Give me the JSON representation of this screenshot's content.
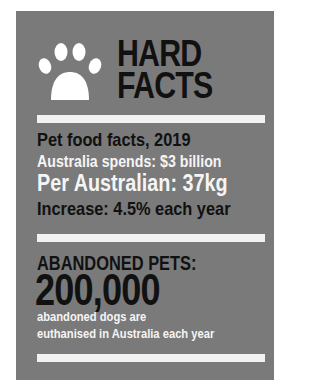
{
  "header": {
    "icon": "paw-icon",
    "title_line1": "HARD",
    "title_line2": "FACTS"
  },
  "pet_food": {
    "heading": "Pet food facts, 2019",
    "spend": "Australia spends: $3 billion",
    "per_person": "Per Australian: 37kg",
    "increase": "Increase: 4.5% each year"
  },
  "abandoned": {
    "heading": "ABANDONED PETS:",
    "number": "200,000",
    "desc_line1": "abandoned dogs are",
    "desc_line2": "euthanised in Australia each year"
  },
  "colors": {
    "panel": "#7a7a7a",
    "bar": "#f2f2f2",
    "dark_text": "#111111",
    "light_text": "#f5f5f5"
  }
}
